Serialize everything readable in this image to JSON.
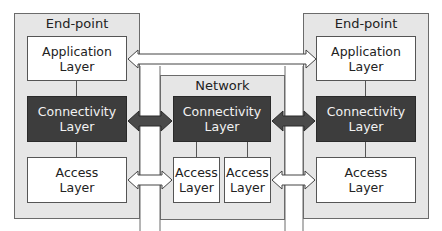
{
  "diagram": {
    "left_endpoint": {
      "title": "End-point",
      "application": "Application\nLayer",
      "connectivity": "Connectivity\nLayer",
      "access": "Access\nLayer"
    },
    "network": {
      "title": "Network",
      "connectivity": "Connectivity\nLayer",
      "access_left": "Access\nLayer",
      "access_right": "Access\nLayer"
    },
    "right_endpoint": {
      "title": "End-point",
      "application": "Application\nLayer",
      "connectivity": "Connectivity\nLayer",
      "access": "Access\nLayer"
    },
    "connections": [
      {
        "from": "left_endpoint.application",
        "to": "right_endpoint.application",
        "style": "hollow-double-arrow"
      },
      {
        "from": "left_endpoint.connectivity",
        "to": "network.connectivity",
        "style": "dark-double-arrow"
      },
      {
        "from": "network.connectivity",
        "to": "right_endpoint.connectivity",
        "style": "dark-double-arrow"
      },
      {
        "from": "left_endpoint.access",
        "to": "network.access_left",
        "style": "hollow-double-arrow"
      },
      {
        "from": "network.access_right",
        "to": "right_endpoint.access",
        "style": "hollow-double-arrow"
      }
    ],
    "colors": {
      "container_fill": "#e6e6e6",
      "dark_layer_fill": "#3d3d3d",
      "light_layer_fill": "#ffffff",
      "border": "#555555"
    }
  }
}
